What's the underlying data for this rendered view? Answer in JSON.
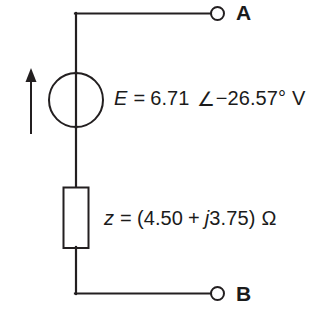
{
  "diagram": {
    "kind": "circuit-schematic",
    "stroke_color": "#231f20",
    "background_color": "#ffffff"
  },
  "terminals": {
    "top": {
      "name": "A",
      "label": "A"
    },
    "bottom": {
      "name": "B",
      "label": "B"
    }
  },
  "source": {
    "name": "voltage-source",
    "symbol": "circle-with-vertical-line",
    "polarity_arrow": "up",
    "label": {
      "quantity": "E",
      "equals": "=",
      "magnitude": "6.71",
      "angle_symbol": "∠",
      "phase": "−26.57°",
      "unit": "V",
      "full": "E = 6.71 ∠−26.57° V"
    }
  },
  "impedance": {
    "name": "series-impedance",
    "symbol": "rectangle-box",
    "label": {
      "quantity": "z",
      "equals": "=",
      "open_paren": "(",
      "real": "4.50",
      "plus": "+",
      "imag_unit": "j",
      "imag": "3.75",
      "close_paren": ")",
      "unit": "Ω",
      "full": "z = (4.50 + j3.75) Ω"
    }
  },
  "wires": {
    "top_lead": "from source node up and right to terminal A",
    "bottom_lead": "from impedance down and right to terminal B",
    "vertical_trunk": "source to impedance"
  }
}
